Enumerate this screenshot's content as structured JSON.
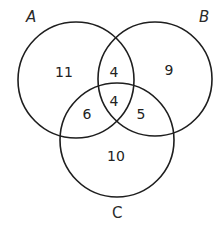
{
  "diagram": {
    "type": "venn-3",
    "sets": [
      {
        "id": "A",
        "label": "A",
        "cx": 76,
        "cy": 80,
        "r": 58,
        "label_x": 26,
        "label_y": 22,
        "italic": true
      },
      {
        "id": "B",
        "label": "B",
        "cx": 155,
        "cy": 79,
        "r": 57,
        "label_x": 199,
        "label_y": 22,
        "italic": true
      },
      {
        "id": "C",
        "label": "C",
        "cx": 117,
        "cy": 140,
        "r": 57,
        "label_x": 112,
        "label_y": 218,
        "italic": false
      }
    ],
    "regions": [
      {
        "id": "A_only",
        "sets": [
          "A"
        ],
        "value": "11",
        "x": 64,
        "y": 72
      },
      {
        "id": "A_and_B_only",
        "sets": [
          "A",
          "B"
        ],
        "value": "4",
        "x": 114,
        "y": 72
      },
      {
        "id": "B_only",
        "sets": [
          "B"
        ],
        "value": "9",
        "x": 169,
        "y": 70
      },
      {
        "id": "A_and_C_only",
        "sets": [
          "A",
          "C"
        ],
        "value": "6",
        "x": 87,
        "y": 114
      },
      {
        "id": "A_and_B_and_C",
        "sets": [
          "A",
          "B",
          "C"
        ],
        "value": "4",
        "x": 114,
        "y": 101
      },
      {
        "id": "B_and_C_only",
        "sets": [
          "B",
          "C"
        ],
        "value": "5",
        "x": 141,
        "y": 114
      },
      {
        "id": "C_only",
        "sets": [
          "C"
        ],
        "value": "10",
        "x": 116,
        "y": 156
      }
    ],
    "stroke_color": "#1e1e1e",
    "text_color": "#222222"
  }
}
